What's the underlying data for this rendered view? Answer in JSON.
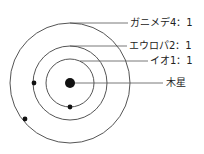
{
  "diagram": {
    "center": {
      "x": 70,
      "y": 83
    },
    "planet": {
      "label": "木星",
      "radius": 5
    },
    "orbits": [
      {
        "name": "io",
        "label": "イオ1：1",
        "radius": 24,
        "moon": {
          "x": 70,
          "y": 107
        }
      },
      {
        "name": "europa",
        "label": "エウロパ2：1",
        "radius": 37,
        "moon": {
          "x": 34,
          "y": 83
        }
      },
      {
        "name": "ganymede",
        "label": "ガニメデ4：1",
        "radius": 60,
        "moon": {
          "x": 25,
          "y": 119
        }
      }
    ],
    "colors": {
      "line": "#555555",
      "dot": "#111111",
      "text": "#222222"
    }
  }
}
